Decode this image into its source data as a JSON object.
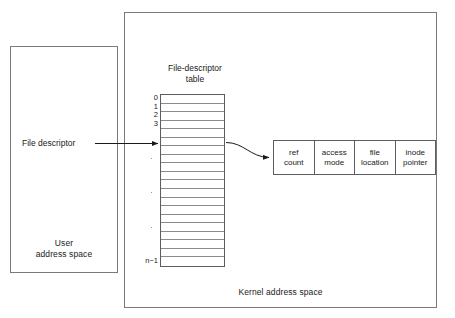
{
  "diagram": {
    "colors": {
      "outline": "#7a7a7a",
      "table_outline": "#5d5d5d",
      "row_rule": "#8b8b8b",
      "arrow": "#1a1a1a",
      "text": "#1a1a1a",
      "background": "#ffffff"
    }
  },
  "user_space": {
    "label": "User\naddress space"
  },
  "kernel_space": {
    "label": "Kernel address space"
  },
  "fd_label": {
    "text": "File descriptor"
  },
  "fd_table": {
    "title": "File-descriptor\ntable",
    "row_count": 20,
    "index_labels": [
      "0",
      "1",
      "2",
      "3"
    ],
    "last_index_label": "n−1",
    "ellipsis_count": 3,
    "pointer_row_index": 5
  },
  "file_entry": {
    "cells": [
      {
        "label": "ref\ncount"
      },
      {
        "label": "access\nmode"
      },
      {
        "label": "file\nlocation"
      },
      {
        "label": "inode\npointer"
      }
    ]
  }
}
